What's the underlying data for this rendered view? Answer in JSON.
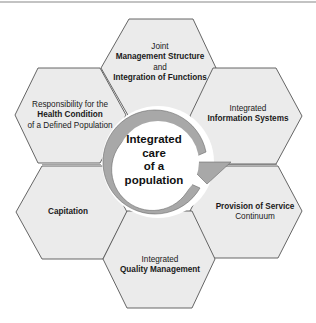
{
  "diagram": {
    "center": {
      "lines": [
        "Integrated",
        "care",
        "of a",
        "population"
      ]
    },
    "hexagons": [
      {
        "id": "top",
        "lines": [
          {
            "text": "Joint",
            "bold": false
          },
          {
            "text": "Management Structure",
            "bold": true
          },
          {
            "text": "and",
            "bold": false
          },
          {
            "text": "Integration of Functions",
            "bold": true
          }
        ]
      },
      {
        "id": "upper-right",
        "lines": [
          {
            "text": "Integrated",
            "bold": false
          },
          {
            "text": "Information Systems",
            "bold": true
          }
        ]
      },
      {
        "id": "lower-right",
        "lines": [
          {
            "text": "Provision of Service",
            "bold": true
          },
          {
            "text": "Continuum",
            "bold": false
          }
        ]
      },
      {
        "id": "bottom",
        "lines": [
          {
            "text": "Integrated",
            "bold": false
          },
          {
            "text": "Quality Management",
            "bold": true
          }
        ]
      },
      {
        "id": "lower-left",
        "lines": [
          {
            "text": "Capitation",
            "bold": true
          }
        ]
      },
      {
        "id": "upper-left",
        "lines": [
          {
            "text": "Responsibility for the",
            "bold": false
          },
          {
            "text": "Health Condition",
            "bold": true
          },
          {
            "text": "of a Defined Population",
            "bold": false
          }
        ]
      }
    ],
    "colors": {
      "hex_fill": "#ebebeb",
      "hex_stroke": "#555555",
      "ring": "#a8a8a8",
      "ring_stroke": "#6a6a6a",
      "center_fill": "#ffffff"
    }
  }
}
